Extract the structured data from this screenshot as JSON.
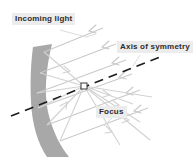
{
  "diagram": {
    "background_color": "#ffffff",
    "labels": {
      "incoming": "Incoming light",
      "axis": "Axis of symmetry",
      "focus": "Focus"
    },
    "label_style": {
      "box_fill": "#ececed",
      "text_color": "#2b2b2b"
    },
    "mirror": {
      "name": "concave-mirror",
      "fill": "#a8a8a8"
    },
    "axis_line": {
      "name": "axis-of-symmetry-line",
      "color": "#1c1c1c",
      "style": "dashed"
    },
    "focus_marker": {
      "name": "focus-point",
      "fill": "#ffffff",
      "stroke": "#333333"
    },
    "rays": {
      "incoming_color": "#c9c9c9",
      "reflected_color": "#d0d0d0",
      "incoming_count": 5,
      "reflected_count": 5,
      "direction": "parallel rays travel left toward mirror and reflect through the focus"
    }
  }
}
